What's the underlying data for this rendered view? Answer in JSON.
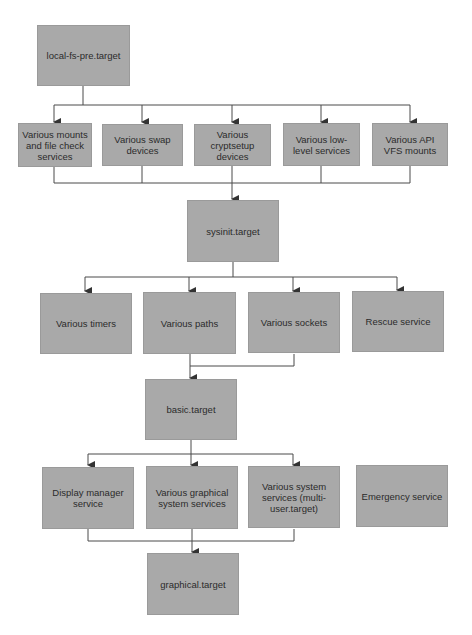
{
  "diagram": {
    "type": "flowchart",
    "colors": {
      "box_fill": "#a9a9a9",
      "line": "#3a3a3a",
      "text": "#2b2b2b",
      "background": "#ffffff"
    },
    "nodes": {
      "local_fs_pre": "local-fs-pre.target",
      "mounts": "Various mounts and file check services",
      "swap": "Various swap devices",
      "cryptsetup": "Various cryptsetup devices",
      "lowlevel": "Various low-level services",
      "apivfs": "Various API VFS mounts",
      "sysinit": "sysinit.target",
      "timers": "Various timers",
      "paths": "Various paths",
      "sockets": "Various sockets",
      "rescue": "Rescue service",
      "basic": "basic.target",
      "display_manager": "Display manager service",
      "graphical_services": "Various graphical system services",
      "system_services": "Various system services (multi-user.target)",
      "emergency": "Emergency service",
      "graphical": "graphical.target"
    },
    "edges": [
      [
        "local_fs_pre",
        "mounts"
      ],
      [
        "local_fs_pre",
        "swap"
      ],
      [
        "local_fs_pre",
        "cryptsetup"
      ],
      [
        "local_fs_pre",
        "lowlevel"
      ],
      [
        "local_fs_pre",
        "apivfs"
      ],
      [
        "mounts",
        "sysinit"
      ],
      [
        "swap",
        "sysinit"
      ],
      [
        "cryptsetup",
        "sysinit"
      ],
      [
        "lowlevel",
        "sysinit"
      ],
      [
        "apivfs",
        "sysinit"
      ],
      [
        "sysinit",
        "timers"
      ],
      [
        "sysinit",
        "paths"
      ],
      [
        "sysinit",
        "sockets"
      ],
      [
        "sysinit",
        "rescue"
      ],
      [
        "paths",
        "basic"
      ],
      [
        "sockets",
        "basic"
      ],
      [
        "basic",
        "display_manager"
      ],
      [
        "basic",
        "graphical_services"
      ],
      [
        "basic",
        "system_services"
      ],
      [
        "display_manager",
        "graphical"
      ],
      [
        "graphical_services",
        "graphical"
      ],
      [
        "system_services",
        "graphical"
      ]
    ]
  }
}
